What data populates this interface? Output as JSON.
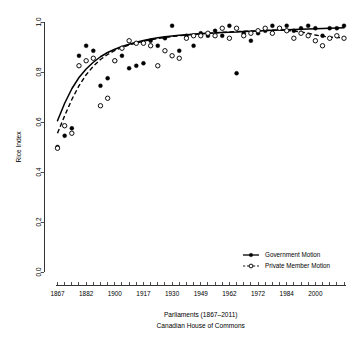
{
  "chart_data": {
    "type": "scatter",
    "title": "",
    "xlabel": "Parliaments (1867–2011)",
    "xlabel2": "Canadian House of Commons",
    "ylabel": "Rice Index",
    "xlim": [
      1,
      41
    ],
    "ylim": [
      0.0,
      1.0
    ],
    "grid": false,
    "legend_position": "bottom-right",
    "y_ticks": [
      "0.0",
      "0.2",
      "0.4",
      "0.6",
      "0.8",
      "1.0"
    ],
    "y_tick_values": [
      0.0,
      0.2,
      0.4,
      0.6,
      0.8,
      1.0
    ],
    "x_tick_labels": [
      "1867",
      "1882",
      "1900",
      "1917",
      "1930",
      "1949",
      "1962",
      "1972",
      "1984",
      "2000"
    ],
    "x_tick_parliaments": [
      1,
      5,
      9,
      13,
      17,
      21,
      25,
      29,
      33,
      37
    ],
    "x_minor_tick_count": 41,
    "series": [
      {
        "name": "Government Motion",
        "marker": "filled-circle",
        "line_style": "solid",
        "x": [
          1,
          2,
          3,
          4,
          5,
          6,
          7,
          8,
          9,
          10,
          11,
          12,
          13,
          14,
          15,
          16,
          17,
          18,
          19,
          20,
          21,
          22,
          23,
          24,
          25,
          26,
          27,
          28,
          29,
          30,
          31,
          32,
          33,
          34,
          35,
          36,
          37,
          38,
          39,
          40,
          41
        ],
        "values": [
          0.5,
          0.545,
          0.575,
          0.865,
          0.905,
          0.885,
          0.745,
          0.775,
          0.845,
          0.865,
          0.815,
          0.825,
          0.835,
          0.925,
          0.905,
          0.935,
          0.985,
          0.885,
          0.945,
          0.905,
          0.955,
          0.945,
          0.965,
          0.945,
          0.985,
          0.795,
          0.955,
          0.925,
          0.955,
          0.965,
          0.985,
          0.975,
          0.985,
          0.965,
          0.975,
          0.985,
          0.975,
          0.945,
          0.975,
          0.975,
          0.985
        ]
      },
      {
        "name": "Private Member Motion",
        "marker": "open-circle",
        "line_style": "dashed",
        "x": [
          1,
          2,
          3,
          4,
          5,
          6,
          7,
          8,
          9,
          10,
          11,
          12,
          13,
          14,
          15,
          16,
          17,
          18,
          19,
          20,
          21,
          22,
          23,
          24,
          25,
          26,
          27,
          28,
          29,
          30,
          31,
          32,
          33,
          34,
          35,
          36,
          37,
          38,
          39,
          40,
          41
        ],
        "values": [
          0.495,
          0.585,
          0.555,
          0.825,
          0.845,
          0.855,
          0.665,
          0.695,
          0.845,
          0.895,
          0.925,
          0.915,
          0.915,
          0.905,
          0.825,
          0.885,
          0.865,
          0.855,
          0.935,
          0.945,
          0.945,
          0.955,
          0.945,
          0.975,
          0.935,
          0.975,
          0.945,
          0.955,
          0.965,
          0.975,
          0.955,
          0.975,
          0.965,
          0.935,
          0.955,
          0.945,
          0.925,
          0.905,
          0.935,
          0.945,
          0.935
        ]
      }
    ],
    "fit_curves": [
      {
        "name": "Government Motion fit",
        "style": "solid",
        "points": [
          [
            1,
            0.605
          ],
          [
            2,
            0.675
          ],
          [
            3,
            0.733
          ],
          [
            4,
            0.778
          ],
          [
            5,
            0.812
          ],
          [
            6,
            0.839
          ],
          [
            7,
            0.861
          ],
          [
            8,
            0.878
          ],
          [
            9,
            0.891
          ],
          [
            10,
            0.902
          ],
          [
            11,
            0.911
          ],
          [
            12,
            0.919
          ],
          [
            13,
            0.926
          ],
          [
            14,
            0.932
          ],
          [
            15,
            0.937
          ],
          [
            16,
            0.941
          ],
          [
            17,
            0.944
          ],
          [
            18,
            0.947
          ],
          [
            19,
            0.949
          ],
          [
            20,
            0.951
          ],
          [
            21,
            0.953
          ],
          [
            22,
            0.955
          ],
          [
            23,
            0.956
          ],
          [
            24,
            0.958
          ],
          [
            25,
            0.959
          ],
          [
            26,
            0.96
          ],
          [
            27,
            0.962
          ],
          [
            28,
            0.963
          ],
          [
            29,
            0.964
          ],
          [
            30,
            0.966
          ],
          [
            31,
            0.967
          ],
          [
            32,
            0.968
          ],
          [
            33,
            0.969
          ],
          [
            34,
            0.97
          ],
          [
            35,
            0.971
          ],
          [
            36,
            0.972
          ],
          [
            37,
            0.973
          ],
          [
            38,
            0.974
          ],
          [
            39,
            0.975
          ],
          [
            40,
            0.976
          ],
          [
            41,
            0.977
          ]
        ]
      },
      {
        "name": "Private Member Motion fit",
        "style": "dashed",
        "points": [
          [
            1,
            0.555
          ],
          [
            2,
            0.625
          ],
          [
            3,
            0.69
          ],
          [
            4,
            0.745
          ],
          [
            5,
            0.789
          ],
          [
            6,
            0.823
          ],
          [
            7,
            0.85
          ],
          [
            8,
            0.87
          ],
          [
            9,
            0.886
          ],
          [
            10,
            0.898
          ],
          [
            11,
            0.908
          ],
          [
            12,
            0.916
          ],
          [
            13,
            0.923
          ],
          [
            14,
            0.929
          ],
          [
            15,
            0.934
          ],
          [
            16,
            0.938
          ],
          [
            17,
            0.942
          ],
          [
            18,
            0.945
          ],
          [
            19,
            0.948
          ],
          [
            20,
            0.951
          ],
          [
            21,
            0.953
          ],
          [
            22,
            0.955
          ],
          [
            23,
            0.957
          ],
          [
            24,
            0.959
          ],
          [
            25,
            0.96
          ],
          [
            26,
            0.962
          ],
          [
            27,
            0.963
          ],
          [
            28,
            0.964
          ],
          [
            29,
            0.965
          ],
          [
            30,
            0.966
          ],
          [
            31,
            0.967
          ],
          [
            32,
            0.967
          ],
          [
            33,
            0.966
          ],
          [
            34,
            0.964
          ],
          [
            35,
            0.96
          ],
          [
            36,
            0.955
          ],
          [
            37,
            0.948
          ],
          [
            38,
            0.943
          ],
          [
            39,
            0.94
          ],
          [
            40,
            0.938
          ],
          [
            41,
            0.937
          ]
        ]
      }
    ],
    "legend": [
      {
        "label": "Government Motion",
        "marker": "filled-circle",
        "line_style": "solid"
      },
      {
        "label": "Private Member Motion",
        "marker": "open-circle",
        "line_style": "dashed"
      }
    ]
  }
}
